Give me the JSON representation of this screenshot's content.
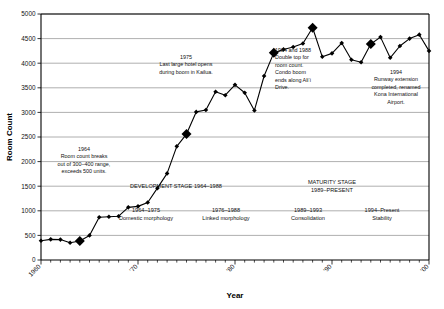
{
  "chart_data": {
    "type": "line",
    "title": "",
    "xlabel": "Year",
    "ylabel": "Room Count",
    "xlim": [
      1960,
      2000
    ],
    "ylim": [
      0,
      5000
    ],
    "ytick_step": 500,
    "ytick_labels": [
      "0",
      "500",
      "1000",
      "1500",
      "2000",
      "2500",
      "3000",
      "3500",
      "4000",
      "4500",
      "5000"
    ],
    "xtick_labels": [
      "1960",
      "'70",
      "'80",
      "'90",
      "'00"
    ],
    "xtick_values": [
      1960,
      1970,
      1980,
      1990,
      2000
    ],
    "minor_tick_step": 1,
    "grid": "horizontal",
    "legend": "none",
    "marker": "diamond",
    "series": [
      {
        "name": "Room Count",
        "x": [
          1960,
          1961,
          1962,
          1963,
          1964,
          1965,
          1966,
          1967,
          1968,
          1969,
          1970,
          1971,
          1972,
          1973,
          1974,
          1975,
          1976,
          1977,
          1978,
          1979,
          1980,
          1981,
          1982,
          1983,
          1984,
          1985,
          1986,
          1987,
          1988,
          1989,
          1990,
          1991,
          1992,
          1993,
          1994,
          1995,
          1996,
          1997,
          1998,
          1999,
          2000
        ],
        "values": [
          390,
          420,
          415,
          350,
          385,
          500,
          870,
          880,
          890,
          1070,
          1090,
          1170,
          1460,
          1760,
          2310,
          2560,
          3010,
          3050,
          3420,
          3350,
          3560,
          3400,
          3040,
          3740,
          4210,
          4280,
          4330,
          4400,
          4720,
          4130,
          4200,
          4410,
          4070,
          4020,
          4390,
          4530,
          4110,
          4350,
          4500,
          4580,
          4250
        ]
      }
    ],
    "highlighted_points": [
      {
        "x": 1964,
        "y": 500
      },
      {
        "x": 1975,
        "y": 3420
      },
      {
        "x": 1984,
        "y": 4720
      },
      {
        "x": 1988,
        "y": 4720
      },
      {
        "x": 1994,
        "y": 4390
      }
    ]
  },
  "annotations": [
    {
      "id": "a1964",
      "year": "1964",
      "lines": [
        "Room count breaks",
        "out of 300–400 range,",
        "exceeds 500 units."
      ]
    },
    {
      "id": "a1975",
      "year": "1975",
      "lines": [
        "Last large hotel opens",
        "during boom in Kailua."
      ]
    },
    {
      "id": "a1984",
      "year": "1984 and 1988",
      "lines": [
        "Double top for",
        "room count.",
        "Condo boom",
        "ends along Ali‘i",
        "Drive."
      ]
    },
    {
      "id": "a1994",
      "year": "1994",
      "lines": [
        "Runway extension",
        "completed, renamed",
        "Kona International",
        "Airport."
      ]
    }
  ],
  "stages": [
    {
      "id": "development",
      "label": "DEVELOPMENT STAGE 1964–1988"
    },
    {
      "id": "maturity",
      "label": "MATURITY STAGE",
      "label2": "1989–PRESENT"
    }
  ],
  "phases": [
    {
      "id": "p1",
      "range": "1964–1975",
      "name": "Domestic  morphology"
    },
    {
      "id": "p2",
      "range": "1976–1988",
      "name": "Linked morphology"
    },
    {
      "id": "p3",
      "range": "1989–1993",
      "name": "Consolidation"
    },
    {
      "id": "p4",
      "range": "1994–Present",
      "name": "Stability"
    }
  ],
  "axes": {
    "x_title": "Year",
    "y_title": "Room Count"
  },
  "colors": {
    "line": "#000000",
    "grid": "#9a9a9a",
    "axis": "#000000",
    "background": "#ffffff"
  }
}
